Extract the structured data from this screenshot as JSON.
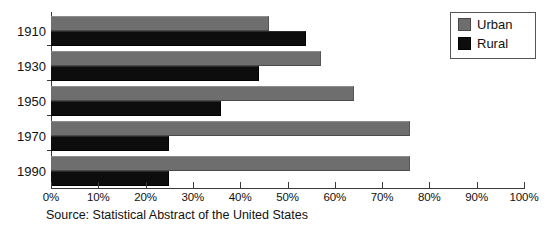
{
  "chart_data": {
    "type": "bar",
    "orientation": "horizontal",
    "title": "",
    "subtitle": "",
    "xlabel": "",
    "ylabel": "",
    "categories": [
      "1910",
      "1930",
      "1950",
      "1970",
      "1990"
    ],
    "series": [
      {
        "name": "Urban",
        "color": "#6e6e6e",
        "values": [
          46,
          57,
          64,
          76,
          76
        ]
      },
      {
        "name": "Rural",
        "color": "#0d0d0d",
        "values": [
          54,
          44,
          36,
          25,
          25
        ]
      }
    ],
    "xlim": [
      0,
      100
    ],
    "xticks": [
      0,
      10,
      20,
      30,
      40,
      50,
      60,
      70,
      80,
      90,
      100
    ],
    "xtick_labels": [
      "0%",
      "10%",
      "20%",
      "30%",
      "40%",
      "50%",
      "60%",
      "70%",
      "80%",
      "90%",
      "100%"
    ],
    "grid": false,
    "legend_position": "top-right",
    "legend_entries": [
      "Urban",
      "Rural"
    ],
    "annotations": [
      "Source:  Statistical Abstract of the United States"
    ]
  },
  "legend": {
    "items": [
      {
        "label": "Urban",
        "color": "#6e6e6e"
      },
      {
        "label": "Rural",
        "color": "#0d0d0d"
      }
    ]
  },
  "source": {
    "text": "Source:  Statistical Abstract of the United States"
  },
  "colors": {
    "urban": "#6e6e6e",
    "rural": "#0d0d0d",
    "axis": "#3a3a3a",
    "text": "#111111",
    "background": "#ffffff"
  }
}
